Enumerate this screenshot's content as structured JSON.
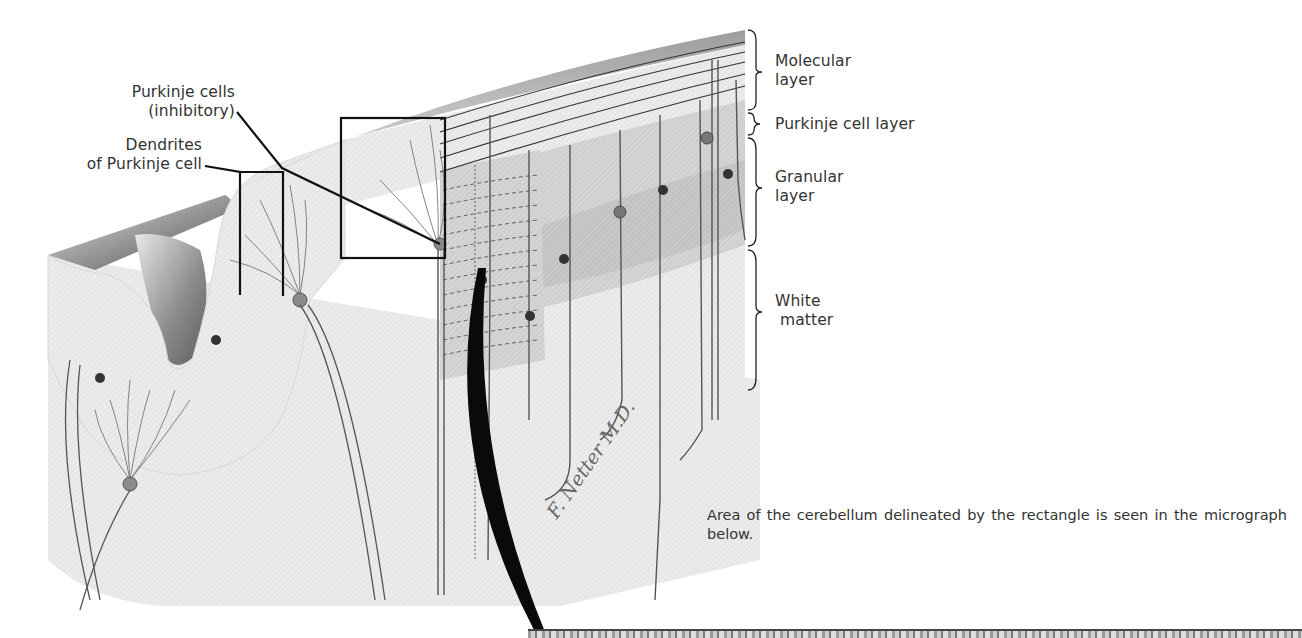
{
  "figure": {
    "callouts": {
      "purkinje_cells_line1": "Purkinje cells",
      "purkinje_cells_line2": "(inhibitory)",
      "dendrites_line1": "Dendrites",
      "dendrites_line2": "of Purkinje cell"
    },
    "layers": [
      {
        "line1": "Molecular",
        "line2": "layer"
      },
      {
        "line1": "Purkinje cell layer",
        "line2": ""
      },
      {
        "line1": "Granular",
        "line2": "layer"
      },
      {
        "line1": "White",
        "line2": "matter"
      }
    ],
    "caption": "Area of the cerebellum delineated by the rectangle is seen in the micrograph below.",
    "signature": "F. Netter M.D.",
    "colors": {
      "tissue_light": "#ececec",
      "tissue_mid": "#d6d6d6",
      "tissue_dark": "#bdbdbd",
      "neuron": "#555555",
      "ink": "#111111"
    }
  }
}
